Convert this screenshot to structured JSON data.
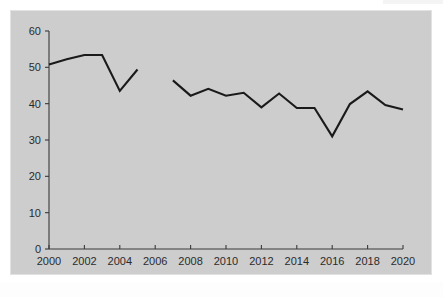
{
  "chart_data": {
    "type": "line",
    "title": "",
    "xlabel": "",
    "ylabel": "",
    "xlim": [
      2000,
      2020
    ],
    "ylim": [
      0,
      60
    ],
    "grid": false,
    "legend": "none",
    "xticks": [
      "2000",
      "2002",
      "2004",
      "2006",
      "2008",
      "2010",
      "2012",
      "2014",
      "2016",
      "2018",
      "2020"
    ],
    "yticks": [
      "0",
      "10",
      "20",
      "30",
      "40",
      "50",
      "60"
    ],
    "series": [
      {
        "name": "segment-1",
        "x": [
          2000,
          2001,
          2002,
          2003,
          2004,
          2005
        ],
        "values": [
          50.8,
          52.2,
          53.4,
          53.4,
          43.5,
          49.4
        ]
      },
      {
        "name": "segment-2",
        "x": [
          2007,
          2008,
          2009,
          2010,
          2011,
          2012,
          2013,
          2014,
          2015,
          2016,
          2017,
          2018,
          2019,
          2020
        ],
        "values": [
          46.4,
          42.2,
          44.1,
          42.2,
          43.0,
          39.0,
          42.8,
          38.8,
          38.8,
          31.0,
          39.9,
          43.4,
          39.6,
          38.4
        ]
      }
    ]
  },
  "colors": {
    "plot_background": "#cdcdcd",
    "page_background": "#ffffff",
    "line": "#1a1a1a",
    "axis": "#3a3a3a",
    "tick_text": "#2b2b2b"
  }
}
